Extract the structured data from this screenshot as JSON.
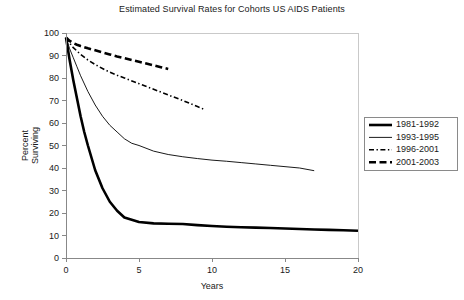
{
  "chart_data": {
    "type": "line",
    "title": "Estimated Survival Rates for Cohorts US AIDS Patients",
    "xlabel": "Years",
    "ylabel": "Percent Surviving",
    "xlim": [
      0,
      20
    ],
    "ylim": [
      0,
      100
    ],
    "xticks": [
      0,
      5,
      10,
      15,
      20
    ],
    "yticks": [
      0,
      10,
      20,
      30,
      40,
      50,
      60,
      70,
      80,
      90,
      100
    ],
    "xtick_labels": [
      "0",
      "5",
      "10",
      "15",
      "20"
    ],
    "ytick_labels": [
      "0",
      "10",
      "20",
      "30",
      "40",
      "50",
      "60",
      "70",
      "80",
      "90",
      "100"
    ],
    "grid": false,
    "legend_position": "right",
    "series": [
      {
        "name": "1981-1992",
        "style": "thick-solid",
        "stroke_width": 2.6,
        "dash": "none",
        "color": "#000000",
        "x": [
          0,
          0.25,
          0.5,
          0.75,
          1,
          1.25,
          1.5,
          2,
          2.5,
          3,
          3.5,
          4,
          4.5,
          5,
          6,
          7,
          8,
          9,
          10,
          11,
          12,
          13,
          14,
          15,
          16,
          17,
          18,
          19,
          20
        ],
        "y": [
          98,
          88,
          79,
          71,
          63,
          56,
          50,
          39,
          31,
          25,
          21,
          18,
          17,
          16,
          15.4,
          15.2,
          15.1,
          14.6,
          14.2,
          13.9,
          13.7,
          13.5,
          13.3,
          13.1,
          12.9,
          12.7,
          12.5,
          12.3,
          12.1
        ]
      },
      {
        "name": "1993-1995",
        "style": "thin-solid",
        "stroke_width": 0.9,
        "dash": "none",
        "color": "#555555",
        "x": [
          0,
          0.25,
          0.5,
          0.75,
          1,
          1.5,
          2,
          2.5,
          3,
          3.5,
          4,
          4.5,
          5,
          6,
          7,
          8,
          9,
          10,
          11,
          12,
          13,
          14,
          15,
          16,
          17
        ],
        "y": [
          98,
          93,
          89,
          85,
          81,
          74,
          68,
          63,
          59,
          56,
          53,
          51,
          50,
          47.5,
          46,
          45,
          44.2,
          43.5,
          43,
          42.4,
          41.8,
          41.2,
          40.6,
          40,
          38.8
        ]
      },
      {
        "name": "1996-2001",
        "style": "dash-dot-fine",
        "stroke_width": 1.6,
        "dash": "5,2.5,1.4,2.5",
        "color": "#000000",
        "x": [
          0,
          0.25,
          0.5,
          0.75,
          1,
          1.5,
          2,
          2.5,
          3,
          3.5,
          4,
          5,
          6,
          7,
          8,
          9,
          9.5
        ],
        "y": [
          98,
          95.5,
          93.5,
          92,
          90.5,
          88,
          86,
          84.2,
          82.6,
          81.2,
          80,
          77.5,
          75,
          72.5,
          70,
          67.3,
          66
        ]
      },
      {
        "name": "2001-2003",
        "style": "thick-dash",
        "stroke_width": 2.6,
        "dash": "7,3.5",
        "color": "#000000",
        "x": [
          0,
          0.25,
          0.5,
          0.75,
          1,
          1.5,
          2,
          2.5,
          3,
          3.5,
          4,
          4.5,
          5,
          5.5,
          6,
          6.5,
          7
        ],
        "y": [
          98,
          96.5,
          95.5,
          94.8,
          94.2,
          93.2,
          92.3,
          91.4,
          90.5,
          89.6,
          88.8,
          88,
          87.2,
          86.4,
          85.6,
          84.8,
          84
        ]
      }
    ]
  },
  "legend": {
    "entries": [
      {
        "label": "1981-1992"
      },
      {
        "label": "1993-1995"
      },
      {
        "label": "1996-2001"
      },
      {
        "label": "2001-2003"
      }
    ]
  }
}
